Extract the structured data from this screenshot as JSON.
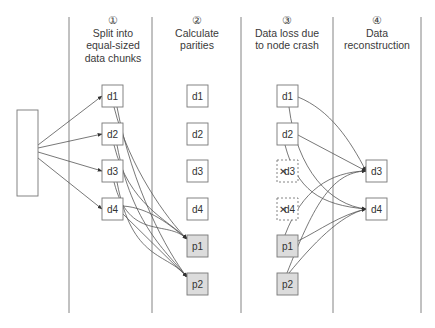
{
  "columns": [
    {
      "id": "split",
      "number": "①",
      "title_lines": [
        "Split into",
        "equal-sized",
        "data chunks"
      ],
      "center_x": 113
    },
    {
      "id": "parity",
      "number": "②",
      "title_lines": [
        "Calculate",
        "parities"
      ],
      "center_x": 197
    },
    {
      "id": "loss",
      "number": "③",
      "title_lines": [
        "Data loss due",
        "to node crash"
      ],
      "center_x": 287
    },
    {
      "id": "reconstruct",
      "number": "④",
      "title_lines": [
        "Data",
        "reconstruction"
      ],
      "center_x": 377
    }
  ],
  "dividers_x": [
    69,
    152,
    241,
    333,
    421
  ],
  "source": {
    "label": "",
    "x": 17,
    "y": 110,
    "w": 21,
    "h": 86
  },
  "boxes": {
    "split": [
      {
        "label": "d1",
        "style": "data",
        "x": 102,
        "y": 85
      },
      {
        "label": "d2",
        "style": "data",
        "x": 102,
        "y": 123
      },
      {
        "label": "d3",
        "style": "data",
        "x": 102,
        "y": 160
      },
      {
        "label": "d4",
        "style": "data",
        "x": 102,
        "y": 198
      }
    ],
    "parity": [
      {
        "label": "d1",
        "style": "data",
        "x": 187,
        "y": 85
      },
      {
        "label": "d2",
        "style": "data",
        "x": 187,
        "y": 123
      },
      {
        "label": "d3",
        "style": "data",
        "x": 187,
        "y": 160
      },
      {
        "label": "d4",
        "style": "data",
        "x": 187,
        "y": 198
      },
      {
        "label": "p1",
        "style": "parity",
        "x": 187,
        "y": 235
      },
      {
        "label": "p2",
        "style": "parity",
        "x": 187,
        "y": 273
      }
    ],
    "loss": [
      {
        "label": "d1",
        "style": "data",
        "x": 277,
        "y": 85
      },
      {
        "label": "d2",
        "style": "data",
        "x": 277,
        "y": 123
      },
      {
        "label": "d3",
        "style": "lost",
        "x": 277,
        "y": 160
      },
      {
        "label": "d4",
        "style": "lost",
        "x": 277,
        "y": 198
      },
      {
        "label": "p1",
        "style": "parity",
        "x": 277,
        "y": 235
      },
      {
        "label": "p2",
        "style": "parity",
        "x": 277,
        "y": 273
      }
    ],
    "reconstruct": [
      {
        "label": "d3",
        "style": "data",
        "x": 366,
        "y": 160
      },
      {
        "label": "d4",
        "style": "data",
        "x": 366,
        "y": 198
      }
    ]
  },
  "colors": {
    "line": "#555555",
    "box_border": "#777777",
    "parity_fill": "#dcdcdc",
    "divider": "#666666"
  }
}
